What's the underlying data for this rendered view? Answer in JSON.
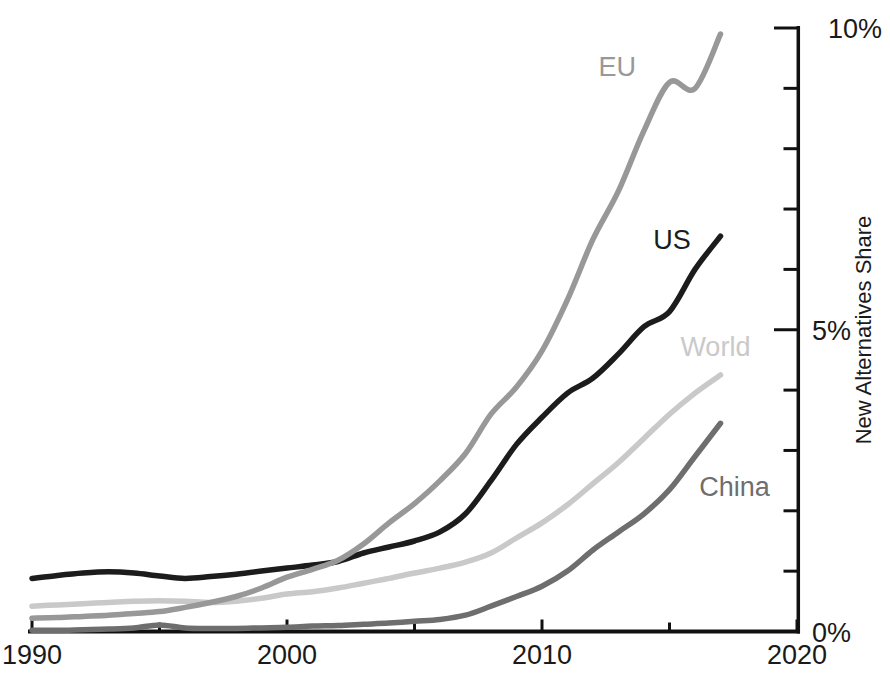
{
  "chart_data": {
    "type": "line",
    "title": "",
    "xlabel": "",
    "ylabel": "New Alternatives Share",
    "xlim": [
      1990,
      2020
    ],
    "ylim": [
      0,
      10
    ],
    "grid": false,
    "legend": "inline-labels",
    "axis_color": "#111111",
    "x": [
      1990,
      1991,
      1992,
      1993,
      1994,
      1995,
      1996,
      1997,
      1998,
      1999,
      2000,
      2001,
      2002,
      2003,
      2004,
      2005,
      2006,
      2007,
      2008,
      2009,
      2010,
      2011,
      2012,
      2013,
      2014,
      2015,
      2016,
      2017
    ],
    "x_ticks_major": [
      1990,
      2000,
      2010,
      2020
    ],
    "x_tick_labels": [
      "1990",
      "2000",
      "2010",
      "2020"
    ],
    "x_ticks_minor": [
      1995,
      2005,
      2015
    ],
    "y_ticks_major": [
      0,
      5,
      10
    ],
    "y_tick_labels": [
      "0%",
      "5%",
      "10%"
    ],
    "y_ticks_minor": [
      1,
      2,
      3,
      4,
      6,
      7,
      8,
      9
    ],
    "series": [
      {
        "name": "World",
        "color": "#c9c9c9",
        "label_anchor": {
          "year": 2016.8,
          "pct": 4.72
        },
        "values": [
          0.42,
          0.44,
          0.46,
          0.48,
          0.5,
          0.51,
          0.5,
          0.48,
          0.5,
          0.55,
          0.62,
          0.66,
          0.72,
          0.8,
          0.88,
          0.97,
          1.05,
          1.15,
          1.3,
          1.55,
          1.8,
          2.1,
          2.45,
          2.8,
          3.2,
          3.6,
          3.95,
          4.25
        ]
      },
      {
        "name": "US",
        "color": "#1c1c1c",
        "label_anchor": {
          "year": 2015.1,
          "pct": 6.5
        },
        "values": [
          0.88,
          0.93,
          0.97,
          0.99,
          0.97,
          0.92,
          0.88,
          0.91,
          0.95,
          1.0,
          1.05,
          1.1,
          1.16,
          1.3,
          1.4,
          1.5,
          1.65,
          1.95,
          2.5,
          3.1,
          3.55,
          3.95,
          4.2,
          4.6,
          5.05,
          5.3,
          6.0,
          6.55
        ]
      },
      {
        "name": "EU",
        "color": "#989898",
        "label_anchor": {
          "year": 2012.95,
          "pct": 9.36
        },
        "values": [
          0.22,
          0.23,
          0.25,
          0.27,
          0.3,
          0.33,
          0.4,
          0.48,
          0.58,
          0.72,
          0.9,
          1.03,
          1.18,
          1.45,
          1.8,
          2.12,
          2.5,
          2.95,
          3.6,
          4.05,
          4.65,
          5.5,
          6.5,
          7.3,
          8.3,
          9.1,
          9.0,
          9.9
        ]
      },
      {
        "name": "China",
        "color": "#6e6e6e",
        "label_anchor": {
          "year": 2017.55,
          "pct": 2.4
        },
        "values": [
          0.02,
          0.02,
          0.03,
          0.04,
          0.06,
          0.11,
          0.06,
          0.05,
          0.05,
          0.06,
          0.07,
          0.09,
          0.1,
          0.12,
          0.14,
          0.17,
          0.2,
          0.27,
          0.42,
          0.58,
          0.75,
          1.0,
          1.35,
          1.65,
          1.95,
          2.35,
          2.9,
          3.45
        ]
      }
    ]
  }
}
